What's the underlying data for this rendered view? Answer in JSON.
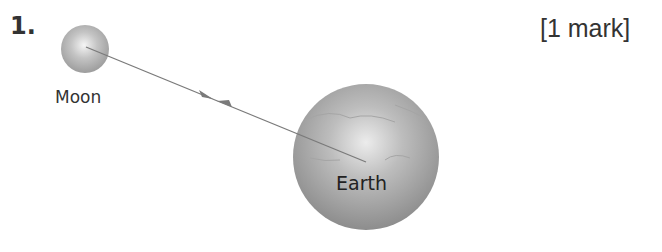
{
  "question": {
    "number": "1.",
    "marks": "[1 mark]"
  },
  "diagram": {
    "bodies": [
      {
        "name": "Moon",
        "label": "Moon"
      },
      {
        "name": "Earth",
        "label": "Earth"
      }
    ],
    "force_line": {
      "from": "Moon",
      "to": "Earth",
      "arrows": [
        "towards Earth",
        "towards Moon"
      ]
    },
    "colors": {
      "line": "#7a7a7a",
      "body": "#9a9a9a",
      "highlight": "#f2f2f2"
    }
  }
}
